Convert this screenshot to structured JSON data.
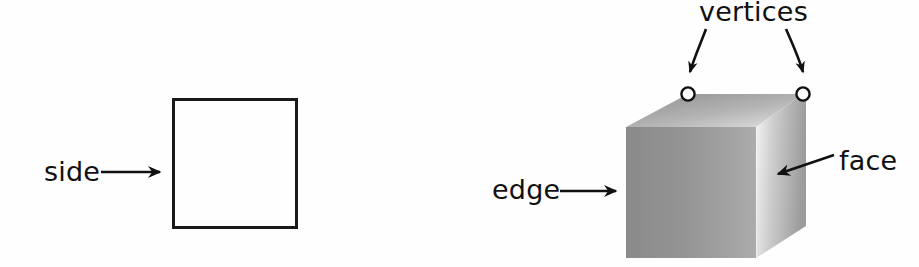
{
  "figure": {
    "background_color": "#ffffff",
    "ink_color": "#111111"
  },
  "shapes": {
    "square": {
      "name": "square",
      "stroke_color": "#1a1a1a",
      "stroke_width": 3,
      "x": 172,
      "y": 98,
      "width": 125,
      "height": 130
    },
    "cube": {
      "name": "cube",
      "front_face_fill_dark": "#8e8e8e",
      "front_face_fill_light": "#a9a9a9",
      "top_face_fill_dark": "#9a9a9a",
      "top_face_fill_light": "#d8d8d8",
      "right_face_fill_dark": "#f2f2f2",
      "right_face_fill_light": "#9c9c9c",
      "front": {
        "left": 626,
        "right": 756,
        "top": 127,
        "bottom": 258
      },
      "top": {
        "tl_x": 688,
        "tl_y": 94,
        "tr_x": 803,
        "tr_y": 94
      },
      "right": {
        "br_x": 806,
        "br_y": 226
      }
    }
  },
  "labels": [
    {
      "id": "side",
      "text": "side",
      "x": 44,
      "y": 181,
      "pointer": "straight-arrow-right",
      "arrow_from": [
        101,
        172
      ],
      "arrow_to": [
        168,
        172
      ]
    },
    {
      "id": "vertices",
      "text": "vertices",
      "x": 699,
      "y": 21,
      "pointer": "two-curved-arrows-down",
      "arrow_left_from": [
        705,
        28
      ],
      "arrow_left_to": [
        690,
        83
      ],
      "arrow_right_from": [
        787,
        28
      ],
      "arrow_right_to": [
        804,
        83
      ]
    },
    {
      "id": "edge",
      "text": "edge",
      "x": 492,
      "y": 199,
      "pointer": "straight-arrow-right",
      "arrow_from": [
        560,
        191
      ],
      "arrow_to": [
        623,
        191
      ]
    },
    {
      "id": "face",
      "text": "face",
      "x": 839,
      "y": 170,
      "pointer": "diagonal-arrow-down-left",
      "arrow_from": [
        834,
        155
      ],
      "arrow_to": [
        770,
        177
      ]
    }
  ],
  "vertex_markers": [
    {
      "id": "vertex-left",
      "cx": 688,
      "cy": 94,
      "r": 7
    },
    {
      "id": "vertex-right",
      "cx": 803,
      "cy": 94,
      "r": 7
    }
  ]
}
